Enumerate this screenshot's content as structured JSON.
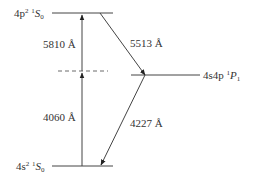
{
  "diagram": {
    "type": "energy-level-diagram",
    "levels": {
      "upper": {
        "config": "4p",
        "config_sup": "2",
        "term_mult": "1",
        "term_L": "S",
        "term_J": "0"
      },
      "intermediate": {
        "config": "4s4p",
        "term_mult": "1",
        "term_L": "P",
        "term_J": "1"
      },
      "ground": {
        "config": "4s",
        "config_sup": "2",
        "term_mult": "1",
        "term_L": "S",
        "term_J": "0"
      },
      "virtual": {
        "style": "dashed"
      }
    },
    "transitions": {
      "absorb_upper": "5810 Å",
      "absorb_lower": "4060 Å",
      "emit_upper": "5513 Å",
      "emit_lower": "4227 Å"
    },
    "colors": {
      "line": "#333333",
      "text": "#333333"
    }
  }
}
